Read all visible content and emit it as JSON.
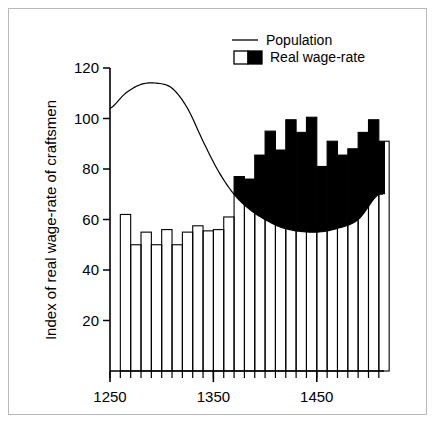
{
  "figure": {
    "frame_color": "#b9b9b9",
    "background": "#ffffff"
  },
  "chart_data": {
    "type": "bar",
    "title": "",
    "subtitle": "",
    "xlabel": "",
    "ylabel": "Index of real wage-rate of craftsmen",
    "xlim": [
      1250,
      1515
    ],
    "ylim": [
      0,
      124
    ],
    "grid": false,
    "legend_position": "top-right",
    "xticks": [
      1250,
      1350,
      1450
    ],
    "xtick_labels": [
      "1250",
      "1350",
      "1450"
    ],
    "yticks": [
      20,
      40,
      60,
      80,
      100,
      120
    ],
    "ytick_labels": [
      "20",
      "40",
      "60",
      "80",
      "100",
      "120"
    ],
    "xtick_minor_step": 10,
    "bar_fill_white": "#ffffff",
    "bar_fill_black": "#000000",
    "bar_edge": "#000000",
    "line_color": "#000000",
    "categories": [
      "1260",
      "1270",
      "1280",
      "1290",
      "1300",
      "1310",
      "1320",
      "1330",
      "1340",
      "1350",
      "1360",
      "1370",
      "1380",
      "1390",
      "1400",
      "1410",
      "1420",
      "1430",
      "1440",
      "1450",
      "1460",
      "1470",
      "1480",
      "1490",
      "1500",
      "1510"
    ],
    "series": [
      {
        "name": "Real wage-rate",
        "type": "bar",
        "values": [
          62,
          50,
          55,
          50,
          56,
          50,
          55,
          57.5,
          55.5,
          56,
          61,
          77,
          76,
          85.5,
          95,
          87.5,
          99.5,
          94.5,
          100.5,
          81,
          91,
          85.5,
          88,
          94.5,
          99.5,
          91
        ]
      },
      {
        "name": "Population",
        "type": "line",
        "x": [
          1250,
          1265,
          1280,
          1295,
          1310,
          1325,
          1340,
          1355,
          1370,
          1385,
          1400,
          1415,
          1430,
          1450,
          1470,
          1490,
          1510
        ],
        "values": [
          104,
          110,
          113.5,
          114,
          112,
          104,
          91,
          79,
          70,
          64,
          60,
          57,
          55.5,
          55,
          56.5,
          60,
          70
        ]
      }
    ],
    "annotations": []
  },
  "legend": {
    "items": [
      {
        "label": "Population",
        "marker": "line",
        "color": "#000000"
      },
      {
        "label": "Real wage-rate",
        "marker": "split-box",
        "color_left": "#ffffff",
        "color_right": "#000000"
      }
    ]
  }
}
